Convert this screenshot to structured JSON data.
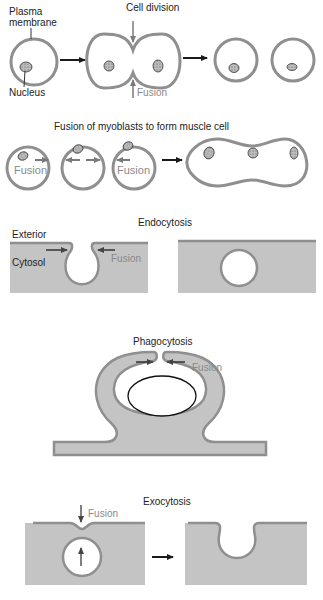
{
  "colors": {
    "membrane": "#8f8f8f",
    "cytosol": "#c4c4c4",
    "arrow_black": "#1a1a1a",
    "fusion_label": "#8a8a8a",
    "background": "#ffffff"
  },
  "panels": {
    "cell_division": {
      "title": "Cell division",
      "labels": {
        "plasma_membrane_1": "Plasma",
        "plasma_membrane_2": "membrane",
        "nucleus": "Nucleus",
        "fusion": "Fusion"
      }
    },
    "myoblast_fusion": {
      "title": "Fusion of myoblasts to form muscle cell",
      "labels": {
        "fusion_left": "Fusion",
        "fusion_right": "Fusion"
      }
    },
    "endocytosis": {
      "title": "Endocytosis",
      "labels": {
        "exterior": "Exterior",
        "cytosol": "Cytosol",
        "fusion": "Fusion"
      }
    },
    "phagocytosis": {
      "title": "Phagocytosis",
      "labels": {
        "fusion": "Fusion"
      }
    },
    "exocytosis": {
      "title": "Exocytosis",
      "labels": {
        "fusion": "Fusion"
      }
    }
  }
}
